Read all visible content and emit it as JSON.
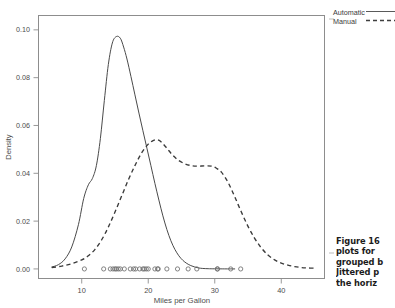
{
  "figure": {
    "kind": "scanned-textbook-figure",
    "background": "#ffffff",
    "ink_color": "#4a4a4a"
  },
  "caption": {
    "lines": [
      "Figure 16",
      "plots for",
      "grouped b",
      "Jittered p",
      "the horiz"
    ],
    "clipped": true
  },
  "legend": {
    "position": "top-right-outside",
    "entries": [
      {
        "label": "Automatic",
        "style": "solid"
      },
      {
        "label": "Manual",
        "style": "dashed"
      }
    ]
  },
  "chart_data": {
    "type": "line",
    "title": "",
    "xlabel": "Miles per Gallon",
    "ylabel": "Density",
    "xlim": [
      3.5,
      46.5
    ],
    "ylim": [
      -0.004,
      0.106
    ],
    "xticks": [
      10,
      20,
      30,
      40
    ],
    "xtick_labels": [
      "10",
      "20",
      "30",
      "40"
    ],
    "yticks": [
      0.0,
      0.02,
      0.04,
      0.06,
      0.08,
      0.1
    ],
    "ytick_labels": [
      "0.00",
      "0.02",
      "0.04",
      "0.06",
      "0.08",
      "0.10"
    ],
    "grid": false,
    "legend_position": "outside right top",
    "series": [
      {
        "name": "Automatic",
        "style": "solid",
        "color": "#4a4a4a",
        "x": [
          5.5,
          6.5,
          7.5,
          8.5,
          9.5,
          10.3,
          11.0,
          11.6,
          12.2,
          12.8,
          13.4,
          14.0,
          14.6,
          15.2,
          15.8,
          16.3,
          16.8,
          17.4,
          18.0,
          18.6,
          19.2,
          19.8,
          20.4,
          21.0,
          21.6,
          22.2,
          22.8,
          23.4,
          24.0,
          24.6,
          25.2,
          25.8,
          26.4,
          27.0,
          27.6,
          28.2,
          29.0,
          30.0,
          31.5,
          33.0
        ],
        "y": [
          0.0008,
          0.0018,
          0.0042,
          0.0092,
          0.0185,
          0.0295,
          0.0352,
          0.0378,
          0.0432,
          0.0545,
          0.0705,
          0.0855,
          0.0945,
          0.0972,
          0.0965,
          0.0928,
          0.0878,
          0.0805,
          0.0728,
          0.0652,
          0.0578,
          0.0505,
          0.0432,
          0.0358,
          0.0288,
          0.0222,
          0.0165,
          0.0118,
          0.0082,
          0.0055,
          0.0036,
          0.0023,
          0.0014,
          0.0008,
          0.0004,
          0.0002,
          0.0001,
          5e-05,
          2e-05,
          1e-05
        ]
      },
      {
        "name": "Manual",
        "style": "dashed",
        "color": "#3a3a3a",
        "x": [
          5.5,
          7.0,
          8.5,
          10.0,
          11.0,
          12.0,
          13.0,
          14.0,
          15.0,
          16.0,
          17.0,
          18.0,
          19.0,
          20.0,
          20.8,
          21.4,
          22.0,
          22.8,
          23.6,
          24.5,
          25.5,
          26.5,
          27.5,
          28.5,
          29.5,
          30.2,
          31.0,
          32.0,
          33.0,
          34.0,
          35.0,
          36.0,
          37.0,
          38.0,
          39.0,
          40.0,
          41.0,
          42.0,
          43.0,
          44.0,
          45.0
        ],
        "y": [
          0.0006,
          0.0012,
          0.0022,
          0.0038,
          0.0055,
          0.0082,
          0.0122,
          0.0175,
          0.0238,
          0.0305,
          0.0372,
          0.0432,
          0.0485,
          0.0522,
          0.0538,
          0.054,
          0.053,
          0.0505,
          0.0478,
          0.0455,
          0.044,
          0.0432,
          0.043,
          0.0431,
          0.043,
          0.0422,
          0.0405,
          0.0362,
          0.0302,
          0.0238,
          0.0178,
          0.0128,
          0.0088,
          0.0058,
          0.0038,
          0.0024,
          0.0016,
          0.001,
          0.0006,
          0.0004,
          0.0003
        ]
      }
    ],
    "rug_points": {
      "name": "jittered-observations",
      "marker": "open-circle",
      "y": 0.0,
      "x": [
        10.4,
        13.3,
        14.3,
        14.7,
        15.0,
        15.2,
        15.5,
        15.8,
        16.4,
        17.3,
        17.8,
        18.1,
        18.7,
        19.2,
        19.4,
        19.7,
        20.0,
        21.0,
        21.4,
        21.5,
        22.8,
        24.4,
        26.0,
        27.3,
        30.4,
        30.4,
        32.4,
        33.9
      ]
    }
  }
}
